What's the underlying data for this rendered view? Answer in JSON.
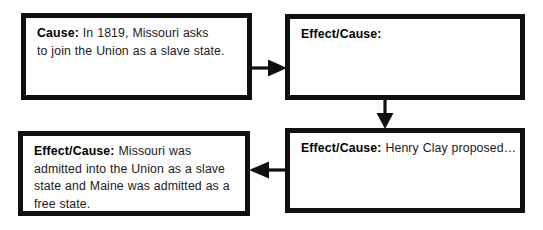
{
  "diagram": {
    "ink_color": "#101010",
    "background_color": "#ffffff",
    "nodes": [
      {
        "id": "cause",
        "label": "Cause:",
        "text": " In 1819, Missouri asks\nto join the Union as a slave state.",
        "position": "top-left"
      },
      {
        "id": "effect_blank",
        "label": "Effect/Cause:",
        "text": "",
        "position": "top-right"
      },
      {
        "id": "effect_final",
        "label": "Effect/Cause:",
        "text": " Missouri was\nadmitted into the Union as a slave\nstate and Maine was admitted as a\nfree state.",
        "position": "bottom-left"
      },
      {
        "id": "effect_clay",
        "label": "Effect/Cause:",
        "text": " Henry Clay proposed…",
        "position": "bottom-right"
      }
    ],
    "connectors": [
      {
        "id": "cause-to-effect",
        "direction": "right",
        "from": "cause",
        "to": "effect_blank"
      },
      {
        "id": "effect-to-clay",
        "direction": "down",
        "from": "effect_blank",
        "to": "effect_clay"
      },
      {
        "id": "clay-to-final",
        "direction": "left",
        "from": "effect_clay",
        "to": "effect_final"
      }
    ]
  }
}
